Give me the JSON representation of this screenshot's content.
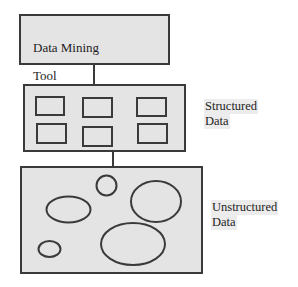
{
  "diagram": {
    "nodes": [
      {
        "id": "data-mining-tool",
        "label": "Data Mining\nTool",
        "label_lines": [
          "Data Mining",
          "Tool"
        ]
      },
      {
        "id": "structured-data",
        "label": "Structured Data",
        "label_lines": [
          "Structured",
          "Data"
        ],
        "contents": "6 rectangles (2 rows x 3 columns)"
      },
      {
        "id": "unstructured-data",
        "label": "Unstructured Data",
        "label_lines": [
          "Unstructured",
          "Data"
        ],
        "contents": "6 ellipses/circles of varying sizes"
      }
    ],
    "edges": [
      {
        "from": "data-mining-tool",
        "to": "structured-data"
      },
      {
        "from": "structured-data",
        "to": "unstructured-data"
      }
    ],
    "colors": {
      "box_fill": "#e4e4e4",
      "stroke": "#3a3a3a",
      "background": "#ffffff",
      "text": "#1e1e1e"
    }
  },
  "labels": {
    "tool_line1": "Data Mining",
    "tool_line2": "Tool",
    "structured_line1": "Structured",
    "structured_line2": "Data",
    "unstructured_line1": "Unstructured",
    "unstructured_line2": "Data"
  },
  "structured_rects": [
    {
      "x": 36,
      "y": 97,
      "w": 28,
      "h": 18
    },
    {
      "x": 83,
      "y": 98,
      "w": 29,
      "h": 19
    },
    {
      "x": 137,
      "y": 98,
      "w": 29,
      "h": 18
    },
    {
      "x": 37,
      "y": 124,
      "w": 29,
      "h": 19
    },
    {
      "x": 83,
      "y": 127,
      "w": 29,
      "h": 19
    },
    {
      "x": 138,
      "y": 124,
      "w": 29,
      "h": 19
    }
  ],
  "unstructured_ellipses": [
    {
      "cx": 106.5,
      "cy": 185.5,
      "rx": 10,
      "ry": 10
    },
    {
      "cx": 68.5,
      "cy": 209.5,
      "rx": 22,
      "ry": 13
    },
    {
      "cx": 156,
      "cy": 201.5,
      "rx": 25,
      "ry": 20.5
    },
    {
      "cx": 49.5,
      "cy": 249,
      "rx": 11,
      "ry": 8
    },
    {
      "cx": 133,
      "cy": 244,
      "rx": 32,
      "ry": 21
    }
  ]
}
